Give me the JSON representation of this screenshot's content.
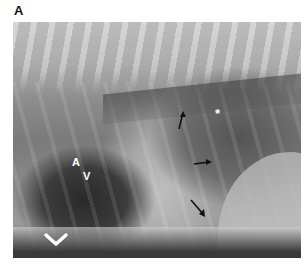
{
  "figure": {
    "panel_label": "A",
    "image_type": "lateral thoracic radiograph",
    "annotations": {
      "letter_a": "A",
      "letter_v": "V",
      "star": "*",
      "arrows": [
        {
          "name": "arrow-up",
          "direction": "up"
        },
        {
          "name": "arrow-right",
          "direction": "right"
        },
        {
          "name": "arrow-down-right",
          "direction": "down-right"
        }
      ],
      "chevron": "chevron-down-icon"
    },
    "colors": {
      "background": "#ffffff",
      "annotation_light": "#ffffff",
      "annotation_dark": "#111111"
    }
  }
}
